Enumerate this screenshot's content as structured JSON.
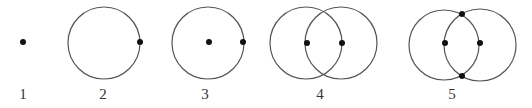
{
  "figure": {
    "panels": [
      {
        "label": "1",
        "label_x": 23,
        "circles": [],
        "points": [
          [
            23,
            42
          ]
        ]
      },
      {
        "label": "2",
        "label_x": 103,
        "circles": [
          [
            104,
            43,
            36
          ]
        ],
        "points": [
          [
            140,
            42
          ]
        ]
      },
      {
        "label": "3",
        "label_x": 205,
        "circles": [
          [
            208,
            43,
            36
          ]
        ],
        "points": [
          [
            209,
            42
          ],
          [
            243,
            42
          ]
        ]
      },
      {
        "label": "4",
        "label_x": 320,
        "circles": [
          [
            306,
            43,
            36
          ],
          [
            341,
            43,
            36
          ]
        ],
        "points": [
          [
            307,
            43
          ],
          [
            342,
            43
          ]
        ]
      },
      {
        "label": "5",
        "label_x": 452,
        "circles": [
          [
            444,
            45,
            35
          ],
          [
            480,
            45,
            36
          ]
        ],
        "points": [
          [
            445,
            43
          ],
          [
            480,
            43
          ],
          [
            462,
            14
          ],
          [
            462,
            76
          ]
        ]
      }
    ],
    "colors": {
      "stroke": "#555555",
      "point": "#111111",
      "label": "#333333"
    }
  }
}
